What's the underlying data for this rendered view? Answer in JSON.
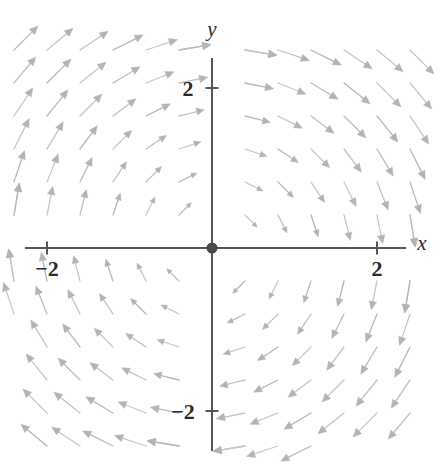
{
  "figure": {
    "kind": "direction-field",
    "background_color": "#ffffff",
    "width": 445,
    "height": 465
  },
  "axes": {
    "x_axis_label": "x",
    "y_axis_label": "y",
    "axis_color": "#555555",
    "axis_line_width": 2.0,
    "tick_length": 13,
    "x_axis_pixel_y": 248,
    "y_axis_pixel_x": 212,
    "x_axis_pixel_start": 25,
    "x_axis_pixel_end": 406,
    "y_axis_pixel_start": 58,
    "y_axis_pixel_end": 451,
    "pixels_per_unit": 82.5,
    "x_ticks": [
      {
        "value": -2,
        "label": "−2",
        "pixel_x": 47,
        "label_pixel_x": 47,
        "label_pixel_y": 276
      },
      {
        "value": 2,
        "label": "2",
        "pixel_x": 377,
        "label_pixel_x": 377,
        "label_pixel_y": 276
      }
    ],
    "y_ticks": [
      {
        "value": 2,
        "label": "2",
        "pixel_y": 88,
        "label_pixel_x": 188,
        "label_pixel_y": 96
      },
      {
        "value": -2,
        "label": "−2",
        "pixel_y": 411,
        "label_pixel_x": 183,
        "label_pixel_y": 419
      }
    ],
    "x_label_position": {
      "pixel_x": 422,
      "pixel_y": 250
    },
    "y_label_position": {
      "pixel_x": 212,
      "pixel_y": 36
    }
  },
  "equilibrium_point": {
    "label": "origin-equilibrium",
    "x": 0,
    "y": 0,
    "pixel_x": 212,
    "pixel_y": 248,
    "radius": 5.5,
    "color": "#4a4a4a"
  },
  "chart_data": {
    "type": "scatter",
    "subtype": "vector-field",
    "title": "",
    "xlabel": "x",
    "ylabel": "y",
    "xlim": [
      -2.6,
      2.6
    ],
    "ylim": [
      -2.6,
      2.6
    ],
    "grid": false,
    "legend_position": "none",
    "annotations": [
      {
        "text": "filled dot at origin marks the equilibrium (center)",
        "x": 0,
        "y": 0
      }
    ],
    "field": {
      "description": "Clockwise rotational direction field about the origin; arrows point down in quadrant II, left in quadrant I, up in quadrant IV, right in quadrant III.",
      "rotation_sense": "clockwise",
      "u_formula": "y",
      "v_formula": "-x",
      "arrow_color": "#bdbdbd",
      "arrow_head_color": "#b4b4b4",
      "arrow_line_width": 1.3,
      "arrow_scale": 0.46,
      "sample_grid": {
        "x_values": [
          -2.4,
          -2.0,
          -1.6,
          -1.2,
          -0.8,
          -0.4,
          0.4,
          0.8,
          1.2,
          1.6,
          2.0,
          2.4
        ],
        "y_values": [
          -2.4,
          -2.0,
          -1.6,
          -1.2,
          -0.8,
          -0.4,
          0.4,
          0.8,
          1.2,
          1.6,
          2.0,
          2.4
        ]
      },
      "quadrant_directions": [
        {
          "quadrant": "I (x>0, y>0)",
          "direction": "left / up-left",
          "example_point": [
            1.2,
            1.2
          ],
          "vector": [
            1.2,
            -1.2
          ]
        },
        {
          "quadrant": "II (x<0, y>0)",
          "direction": "down / down-left",
          "example_point": [
            -1.2,
            1.2
          ],
          "vector": [
            1.2,
            1.2
          ]
        },
        {
          "quadrant": "III (x<0, y<0)",
          "direction": "right / down-right",
          "example_point": [
            -1.2,
            -1.2
          ],
          "vector": [
            -1.2,
            1.2
          ]
        },
        {
          "quadrant": "IV (x>0, y<0)",
          "direction": "up / up-right",
          "example_point": [
            1.2,
            -1.2
          ],
          "vector": [
            -1.2,
            -1.2
          ]
        }
      ],
      "axis_directions": [
        {
          "on_axis": "positive x-axis",
          "direction": "straight up"
        },
        {
          "on_axis": "negative x-axis",
          "direction": "straight down"
        },
        {
          "on_axis": "positive y-axis",
          "direction": "straight left"
        },
        {
          "on_axis": "negative y-axis",
          "direction": "straight right"
        }
      ]
    }
  }
}
